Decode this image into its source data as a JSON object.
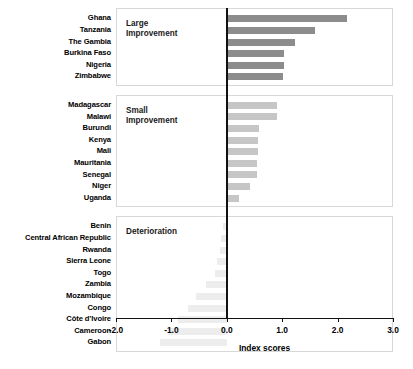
{
  "chart_data": {
    "type": "bar",
    "orientation": "horizontal",
    "title": "",
    "xlabel": "Index scores",
    "ylabel": "",
    "xlim": [
      -2.0,
      3.0
    ],
    "xticks": [
      "-2.0",
      "-1.0",
      "0.0",
      "1.0",
      "2.0",
      "3.0"
    ],
    "xtick_values": [
      -2.0,
      -1.0,
      0.0,
      1.0,
      2.0,
      3.0
    ],
    "grid": false,
    "legend": "none",
    "zero_reference_line": 0.0,
    "panels": [
      {
        "name": "large-improvement",
        "label": "Large\nImprovement",
        "bar_color": "#8c8c8c",
        "categories": [
          "Ghana",
          "Tanzania",
          "The Gambia",
          "Burkina Faso",
          "Nigeria",
          "Zimbabwe"
        ],
        "values": [
          2.17,
          1.59,
          1.23,
          1.03,
          1.03,
          1.02
        ]
      },
      {
        "name": "small-improvement",
        "label": "Small\nImprovement",
        "bar_color": "#c6c6c6",
        "categories": [
          "Madagascar",
          "Malawi",
          "Burundi",
          "Kenya",
          "Mali",
          "Mauritania",
          "Senegal",
          "Niger",
          "Uganda"
        ],
        "values": [
          0.9,
          0.9,
          0.58,
          0.57,
          0.56,
          0.55,
          0.54,
          0.41,
          0.22
        ]
      },
      {
        "name": "deterioration",
        "label": "Deterioration",
        "bar_color": "#ededed",
        "categories": [
          "Benin",
          "Central African Republic",
          "Rwanda",
          "Sierra Leone",
          "Togo",
          "Zambia",
          "Mozambique",
          "Congo",
          "Côte d’Ivoire",
          "Cameroon",
          "Gabon"
        ],
        "values": [
          -0.06,
          -0.1,
          -0.13,
          -0.17,
          -0.21,
          -0.38,
          -0.55,
          -0.7,
          -0.88,
          -1.06,
          -1.21
        ]
      }
    ]
  }
}
